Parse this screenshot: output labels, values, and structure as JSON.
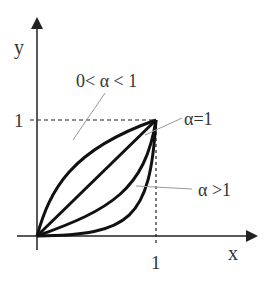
{
  "diagram": {
    "type": "power-function-curves",
    "axes": {
      "x_label": "x",
      "y_label": "y",
      "x_tick": "1",
      "y_tick": "1"
    },
    "annotations": {
      "concave": "0< α < 1",
      "linear": "α=1",
      "convex": "α >1"
    },
    "curves": [
      {
        "name": "concave",
        "alpha": 0.5
      },
      {
        "name": "linear",
        "alpha": 1
      },
      {
        "name": "convex-mild",
        "alpha": 2
      },
      {
        "name": "convex-strong",
        "alpha": 4
      }
    ],
    "colors": {
      "curve": "#111111",
      "axis": "#222222",
      "annotation": "#888888"
    }
  }
}
